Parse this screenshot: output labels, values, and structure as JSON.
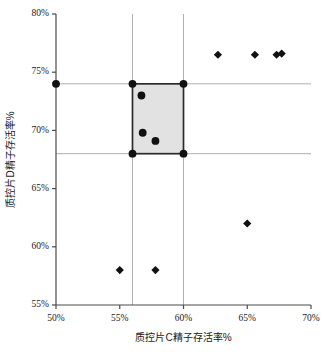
{
  "chart_data": {
    "type": "scatter",
    "title": "",
    "subtitle": "",
    "xlabel": "质控片C精子存活率%",
    "ylabel": "质控片D精子存活率%",
    "xlim": [
      50,
      70
    ],
    "ylim": [
      55,
      80
    ],
    "xticks": [
      50,
      55,
      60,
      65,
      70
    ],
    "yticks": [
      55,
      60,
      65,
      70,
      75,
      80
    ],
    "xtick_labels": [
      "50%",
      "55%",
      "60%",
      "65%",
      "70%"
    ],
    "ytick_labels": [
      "55%",
      "60%",
      "65%",
      "70%",
      "75%",
      "80%"
    ],
    "grid": false,
    "legend": null,
    "legend_position": "none",
    "annotations": [],
    "reference_lines": {
      "vertical": [
        56,
        60
      ],
      "horizontal": [
        68,
        74
      ],
      "color": "#b0b0b0"
    },
    "shaded_region": {
      "x_range": [
        56,
        60
      ],
      "y_range": [
        68,
        74
      ],
      "fill": "#e2e2e2",
      "stroke": "#2b2b2b"
    },
    "series": [
      {
        "name": "圆点",
        "marker": "circle",
        "color": "#111111",
        "points": [
          {
            "x": 50.0,
            "y": 74.0
          },
          {
            "x": 56.0,
            "y": 74.0
          },
          {
            "x": 60.0,
            "y": 74.0
          },
          {
            "x": 56.0,
            "y": 68.0
          },
          {
            "x": 60.0,
            "y": 68.0
          },
          {
            "x": 56.7,
            "y": 73.0
          },
          {
            "x": 56.8,
            "y": 69.8
          },
          {
            "x": 57.8,
            "y": 69.1
          }
        ]
      },
      {
        "name": "菱形",
        "marker": "diamond",
        "color": "#111111",
        "points": [
          {
            "x": 62.7,
            "y": 76.5
          },
          {
            "x": 65.6,
            "y": 76.5
          },
          {
            "x": 67.3,
            "y": 76.5
          },
          {
            "x": 67.7,
            "y": 76.6
          },
          {
            "x": 65.0,
            "y": 62.0
          },
          {
            "x": 55.0,
            "y": 58.0
          },
          {
            "x": 57.8,
            "y": 58.0
          }
        ]
      }
    ]
  },
  "colors": {
    "axis": "#4a4a4a",
    "marker": "#111111",
    "shade_fill": "#e2e2e2",
    "shade_stroke": "#2b2b2b",
    "reference_line": "#b0b0b0",
    "background": "#ffffff"
  }
}
